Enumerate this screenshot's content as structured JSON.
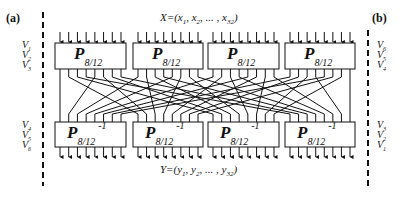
{
  "panels": {
    "left_label": "(a)",
    "right_label": "(b)"
  },
  "input_sequence": {
    "prefix": "X=(x",
    "sub1": "1",
    "mid1": ", x",
    "sub2": "2",
    "mid2": ", ... , x",
    "sub3": "32",
    "suffix": ")"
  },
  "output_sequence": {
    "prefix": "Y=(y",
    "sub1": "1",
    "mid1": ", y",
    "sub2": "2",
    "mid2": ", ... , y",
    "sub3": "32",
    "suffix": ")"
  },
  "left_labels": {
    "top": [
      {
        "v": "V",
        "sub": "1"
      },
      {
        "v": "V",
        "sub": "2"
      },
      {
        "v": "V",
        "sub": "3"
      }
    ],
    "bottom": [
      {
        "v": "V",
        "sub": "4"
      },
      {
        "v": "V",
        "sub": "5"
      },
      {
        "v": "V",
        "sub": "6"
      }
    ]
  },
  "right_labels": {
    "top": [
      {
        "v": "V",
        "sub": "6"
      },
      {
        "v": "V",
        "sub": "5"
      },
      {
        "v": "V",
        "sub": "4"
      }
    ],
    "bottom": [
      {
        "v": "V",
        "sub": "3"
      },
      {
        "v": "V",
        "sub": "2"
      },
      {
        "v": "V",
        "sub": "1"
      }
    ]
  },
  "top_boxes": [
    {
      "main": "P",
      "sub": "8/12"
    },
    {
      "main": "P",
      "sub": "8/12"
    },
    {
      "main": "P",
      "sub": "8/12"
    },
    {
      "main": "P",
      "sub": "8/12"
    }
  ],
  "bottom_boxes": [
    {
      "main": "P",
      "sub": "8/12",
      "sup": "-1"
    },
    {
      "main": "P",
      "sub": "8/12",
      "sup": "-1"
    },
    {
      "main": "P",
      "sub": "8/12",
      "sup": "-1"
    },
    {
      "main": "P",
      "sub": "8/12",
      "sup": "-1"
    }
  ],
  "colors": {
    "line": "#111111",
    "background": "#ffffff"
  }
}
